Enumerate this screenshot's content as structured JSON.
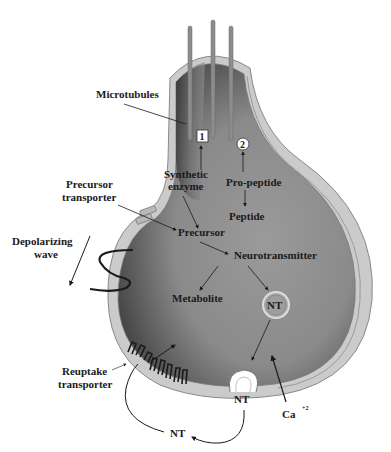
{
  "diagram": {
    "colors": {
      "membrane": "#c9c9c9",
      "membrane_edge": "#8a8a8a",
      "cytoplasm": "#8e8e8e",
      "cytoplasm_dark": "#3e3e3e",
      "microtubule": "#8c8c8c",
      "text": "#1a1a1a",
      "background": "#ffffff"
    },
    "labels": {
      "microtubules": "Microtubules",
      "box_1": "1",
      "box_2": "2",
      "synthetic_enzyme_line1": "Synthetic",
      "synthetic_enzyme_line2": "enzyme",
      "pro_peptide": "Pro-peptide",
      "peptide": "Peptide",
      "precursor_transporter_line1": "Precursor",
      "precursor_transporter_line2": "transporter",
      "precursor": "Precursor",
      "depolarizing_wave_line1": "Depolarizing",
      "depolarizing_wave_line2": "wave",
      "neurotransmitter": "Neurotransmitter",
      "metabolite": "Metabolite",
      "vesicle_nt": "NT",
      "reuptake_transporter_line1": "Reuptake",
      "reuptake_transporter_line2": "transporter",
      "released_nt": "NT",
      "extracellular_nt": "NT",
      "calcium": "Ca",
      "calcium_charge": "+2"
    }
  }
}
